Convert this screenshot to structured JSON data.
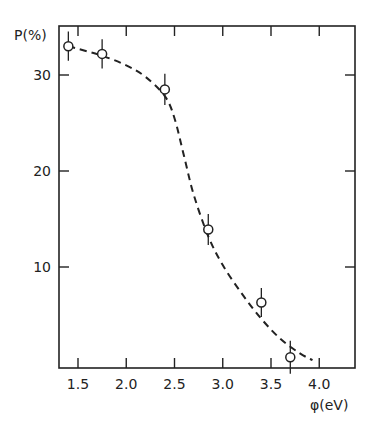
{
  "chart_data": {
    "type": "scatter",
    "title": "",
    "xlabel": "φ(eV)",
    "ylabel": "P(%)",
    "xlim": [
      1.3,
      4.35
    ],
    "ylim": [
      0,
      35.5
    ],
    "grid": false,
    "legend": null,
    "x_ticks": [
      1.5,
      2.0,
      2.5,
      3.0,
      3.5,
      4.0
    ],
    "x_tick_labels": [
      "1.5",
      "2.0",
      "2.5",
      "3.0",
      "3.5",
      "4.0"
    ],
    "y_ticks": [
      10,
      20,
      30
    ],
    "y_tick_labels": [
      "10",
      "20",
      "30"
    ],
    "series": [
      {
        "name": "measured",
        "style": "open-circle-with-error-bars",
        "x": [
          1.4,
          1.75,
          2.4,
          2.85,
          3.4,
          3.7
        ],
        "y": [
          33.0,
          32.2,
          28.5,
          13.9,
          6.3,
          0.6
        ],
        "error": [
          1.0,
          1.0,
          1.1,
          1.1,
          1.0,
          1.2
        ]
      },
      {
        "name": "fit",
        "style": "dashed-line",
        "x": [
          1.4,
          1.75,
          2.0,
          2.2,
          2.4,
          2.5,
          2.6,
          2.7,
          2.85,
          3.0,
          3.2,
          3.4,
          3.6,
          3.8,
          3.93
        ],
        "y": [
          33.0,
          32.0,
          31.0,
          29.8,
          27.8,
          25.5,
          21.5,
          17.5,
          13.2,
          10.2,
          7.2,
          4.6,
          2.5,
          1.0,
          0.3
        ]
      }
    ]
  }
}
